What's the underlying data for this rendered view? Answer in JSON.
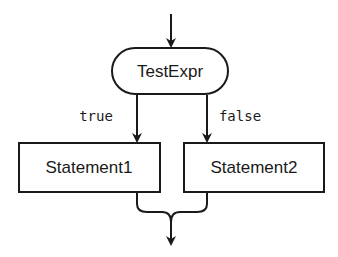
{
  "diagram": {
    "type": "flowchart",
    "nodes": [
      {
        "id": "test",
        "shape": "terminator",
        "label": "TestExpr"
      },
      {
        "id": "s1",
        "shape": "process",
        "label": "Statement1"
      },
      {
        "id": "s2",
        "shape": "process",
        "label": "Statement2"
      }
    ],
    "edges": [
      {
        "from": "entry",
        "to": "test",
        "label": ""
      },
      {
        "from": "test",
        "to": "s1",
        "label": "true"
      },
      {
        "from": "test",
        "to": "s2",
        "label": "false"
      },
      {
        "from": "s1",
        "to": "exit",
        "label": ""
      },
      {
        "from": "s2",
        "to": "exit",
        "label": ""
      }
    ],
    "colors": {
      "line": "#1a1a1a",
      "background": "#ffffff"
    }
  }
}
